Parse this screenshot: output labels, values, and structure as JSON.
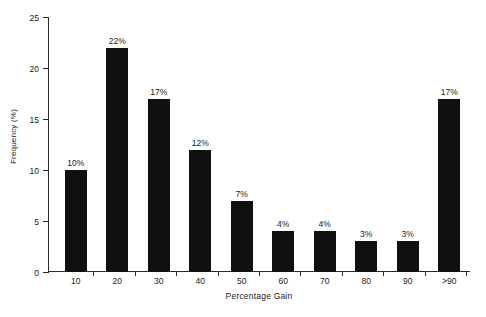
{
  "chart_data": {
    "type": "bar",
    "title": "",
    "xlabel": "Percentage Gain",
    "ylabel": "Frequency (%)",
    "categories": [
      "10",
      "20",
      "30",
      "40",
      "50",
      "60",
      "70",
      "80",
      "90",
      ">90"
    ],
    "values": [
      10,
      22,
      17,
      12,
      7,
      4,
      4,
      3,
      3,
      17
    ],
    "data_labels": [
      "10%",
      "22%",
      "17%",
      "12%",
      "7%",
      "4%",
      "4%",
      "3%",
      "3%",
      "17%"
    ],
    "ylim": [
      0,
      25
    ],
    "yticks": [
      0,
      5,
      10,
      15,
      20,
      25
    ],
    "ytick_labels": [
      "0",
      "5",
      "10",
      "15",
      "20",
      "25"
    ],
    "grid": false,
    "legend": null,
    "bar_color": "#101010",
    "axis_color": "#2b2b2b",
    "background_color": "#ffffff"
  }
}
